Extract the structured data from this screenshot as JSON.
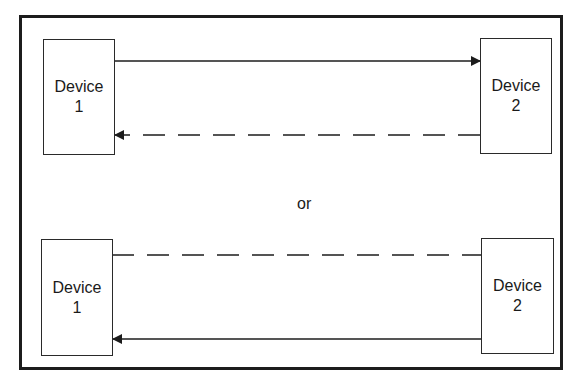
{
  "diagram": {
    "separator_label": "or",
    "scenario_a": {
      "left_device": {
        "name": "Device",
        "number": "1"
      },
      "right_device": {
        "name": "Device",
        "number": "2"
      },
      "links": [
        {
          "style": "solid",
          "from": "Device 1",
          "to": "Device 2",
          "arrow": "right"
        },
        {
          "style": "dashed",
          "from": "Device 2",
          "to": "Device 1",
          "arrow": "left"
        }
      ]
    },
    "scenario_b": {
      "left_device": {
        "name": "Device",
        "number": "1"
      },
      "right_device": {
        "name": "Device",
        "number": "2"
      },
      "links": [
        {
          "style": "dashed",
          "between": [
            "Device 1",
            "Device 2"
          ],
          "arrow": "none"
        },
        {
          "style": "solid",
          "from": "Device 2",
          "to": "Device 1",
          "arrow": "left"
        }
      ]
    },
    "colors": {
      "line": "#1c1c1c",
      "background": "#ffffff"
    }
  }
}
